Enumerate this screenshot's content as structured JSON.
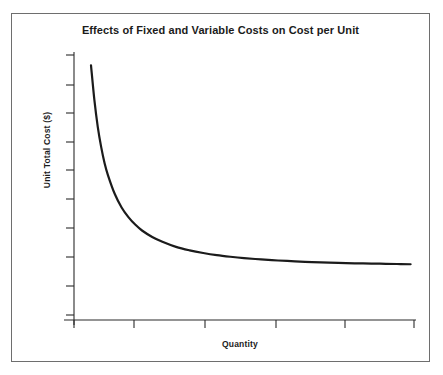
{
  "figure": {
    "width": 443,
    "height": 375,
    "background_color": "#ffffff",
    "frame_color": "#6e6e6e",
    "ink_color": "#1b1b1b"
  },
  "chart_data": {
    "type": "line",
    "title": "Effects of Fixed and Variable Costs on Cost per Unit",
    "xlabel": "Quantity",
    "ylabel": "Unit Total Cost ($)",
    "subtitle": "",
    "grid": false,
    "legend": null,
    "legend_position": "none",
    "axis_tick_labels": {
      "x": [],
      "y": []
    },
    "x_tick_count": 6,
    "y_tick_count": 10,
    "xlim": [
      0,
      10
    ],
    "ylim": [
      0,
      10
    ],
    "series": [
      {
        "name": "Unit Total Cost",
        "color": "#1b1b1b",
        "line_width": 2.2,
        "x": [
          0.5,
          0.6,
          0.7,
          0.8,
          0.9,
          1.0,
          1.2,
          1.4,
          1.6,
          1.8,
          2.0,
          2.3,
          2.6,
          3.0,
          3.4,
          3.8,
          4.2,
          4.6,
          5.0,
          5.5,
          6.0,
          6.5,
          7.0,
          7.5,
          8.0,
          8.5,
          9.0,
          9.5,
          9.9
        ],
        "y": [
          9.5,
          8.2,
          7.2,
          6.45,
          5.85,
          5.4,
          4.7,
          4.2,
          3.84,
          3.56,
          3.34,
          3.1,
          2.92,
          2.73,
          2.6,
          2.5,
          2.42,
          2.36,
          2.31,
          2.26,
          2.22,
          2.19,
          2.16,
          2.14,
          2.12,
          2.11,
          2.1,
          2.09,
          2.08
        ],
        "shape": "hyperbolic-decay",
        "annotation": "Unit total cost falls steeply then flattens toward an asymptote as quantity rises"
      }
    ]
  },
  "axes": {
    "y_axis_name": "unit-total-cost-axis",
    "x_axis_name": "quantity-axis"
  }
}
